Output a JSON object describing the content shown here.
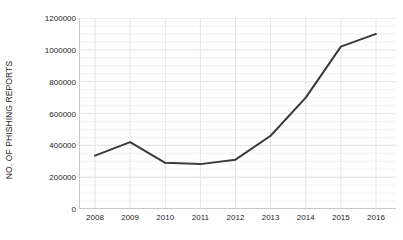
{
  "chart_data": {
    "type": "line",
    "title": "",
    "subtitle": "",
    "xlabel": "",
    "ylabel": "NO. OF PHISHING REPORTS",
    "categories": [
      "2008",
      "2009",
      "2010",
      "2011",
      "2012",
      "2013",
      "2014",
      "2015",
      "2016"
    ],
    "x": [
      2008,
      2009,
      2010,
      2011,
      2012,
      2013,
      2014,
      2015,
      2016
    ],
    "values": [
      335000,
      420000,
      290000,
      282000,
      310000,
      460000,
      700000,
      1020000,
      1100000
    ],
    "series": [
      {
        "name": "No. of phishing reports",
        "values": [
          335000,
          420000,
          290000,
          282000,
          310000,
          460000,
          700000,
          1020000,
          1100000
        ]
      }
    ],
    "ylim": [
      0,
      1200000
    ],
    "ytick_values": [
      0,
      200000,
      400000,
      600000,
      800000,
      1000000,
      1200000
    ],
    "ytick_labels": [
      "0",
      "200000",
      "400000",
      "600000",
      "800000",
      "1000000",
      "1200000"
    ],
    "xtick_labels": [
      "2008",
      "2009",
      "2010",
      "2011",
      "2012",
      "2013",
      "2014",
      "2015",
      "2016"
    ],
    "grid": {
      "horizontal": true,
      "vertical": true,
      "minor_horizontal_step": 50000
    },
    "legend": {
      "visible": false,
      "position": "none"
    },
    "colors": {
      "line": "#3a3a3a",
      "background": "#ffffff",
      "grid_major": "#e4e4e4",
      "grid_minor": "#f2f2f2",
      "axis": "#c9c9c9",
      "text": "#1c1c1c"
    },
    "line_width": 2,
    "markers": false,
    "annotations": []
  }
}
